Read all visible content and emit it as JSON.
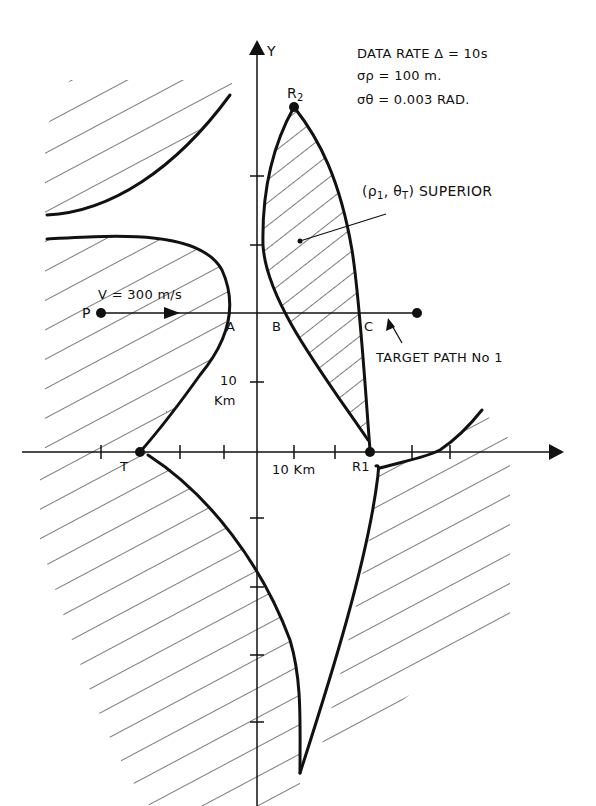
{
  "axes": {
    "y_label": "Y",
    "x_unit_label": "10 Km",
    "y_unit_value": "10",
    "y_unit_suffix": "Km"
  },
  "params": {
    "data_rate": "DATA RATE  Δ = 10s",
    "sigma_rho": "σρ = 100 m.",
    "sigma_theta": "σθ = 0.003 RAD."
  },
  "annotations": {
    "superior_prefix": "(ρ",
    "superior_sub1": "1",
    "superior_mid": ", θ",
    "superior_sub2": "T",
    "superior_suffix": ") SUPERIOR",
    "velocity": "V = 300 m/s",
    "target_path": "TARGET PATH No 1"
  },
  "points": {
    "R2": {
      "label": "R",
      "sub": "2"
    },
    "R1": {
      "label": "R1"
    },
    "T": {
      "label": "T"
    },
    "P": {
      "label": "P"
    },
    "A": {
      "label": "A"
    },
    "B": {
      "label": "B"
    },
    "C": {
      "label": "C"
    }
  },
  "colors": {
    "ink": "#111111",
    "hatch": "#222222",
    "background": "#ffffff"
  }
}
